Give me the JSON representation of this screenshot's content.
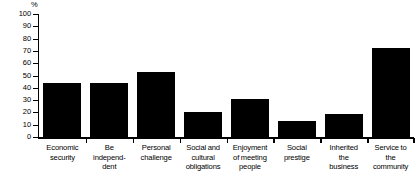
{
  "chart_data": {
    "type": "bar",
    "title": "",
    "xlabel": "",
    "ylabel": "%",
    "ylim": [
      0,
      100
    ],
    "yticks": [
      0,
      10,
      20,
      30,
      40,
      50,
      60,
      70,
      80,
      90,
      100
    ],
    "grid": false,
    "legend": null,
    "bar_color": "#000000",
    "categories": [
      "Economic security",
      "Be independ- dent",
      "Personal challenge",
      "Social and cultural obligations",
      "Enjoyment of meeting people",
      "Social prestige",
      "Inherited the business",
      "Service to the community"
    ],
    "category_lines": [
      [
        "Economic",
        "security"
      ],
      [
        "Be",
        "independ-",
        "dent"
      ],
      [
        "Personal",
        "challenge"
      ],
      [
        "Social and",
        "cultural",
        "obligations"
      ],
      [
        "Enjoyment",
        "of meeting",
        "people"
      ],
      [
        "Social",
        "prestige"
      ],
      [
        "Inherited",
        "the",
        "business"
      ],
      [
        "Service to",
        "the",
        "community"
      ]
    ],
    "values": [
      44,
      44,
      53,
      20,
      31,
      13,
      19,
      72
    ]
  }
}
